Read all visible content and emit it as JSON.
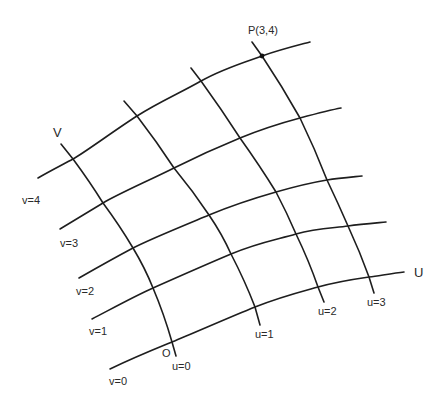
{
  "diagram": {
    "type": "curvilinear-coordinate-grid",
    "axis_labels": {
      "u_axis": "U",
      "v_axis": "V"
    },
    "origin_label": "O",
    "point": {
      "label": "P(3,4)",
      "u": 3,
      "v": 4
    },
    "v_curves": [
      {
        "label": "v=0",
        "value": 0
      },
      {
        "label": "v=1",
        "value": 1
      },
      {
        "label": "v=2",
        "value": 2
      },
      {
        "label": "v=3",
        "value": 3
      },
      {
        "label": "v=4",
        "value": 4
      }
    ],
    "u_curves": [
      {
        "label": "u=0",
        "value": 0
      },
      {
        "label": "u=1",
        "value": 1
      },
      {
        "label": "u=2",
        "value": 2
      },
      {
        "label": "u=3",
        "value": 3
      }
    ],
    "line_color": "#1e1e1e",
    "background_color": "#ffffff"
  }
}
